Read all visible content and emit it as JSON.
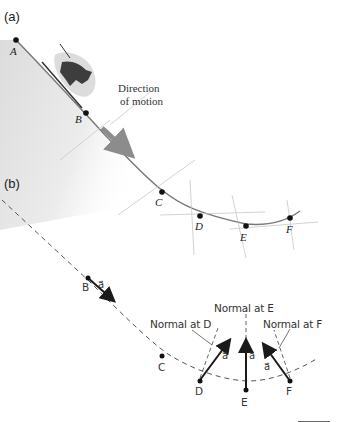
{
  "panels": {
    "a": {
      "label": "(a)"
    },
    "b": {
      "label": "(b)"
    }
  },
  "panel_a": {
    "points": [
      "A",
      "B",
      "C",
      "D",
      "E",
      "F"
    ],
    "direction_label_line1": "Direction",
    "direction_label_line2": "of motion"
  },
  "panel_b": {
    "points": {
      "B": "B",
      "C": "C",
      "D": "D",
      "E": "E",
      "F": "F"
    },
    "vector_symbol": "a⃗",
    "normals": {
      "D": "Normal at D",
      "E": "Normal at E",
      "F": "Normal at F"
    }
  },
  "colors": {
    "slope_fill": "#e3e3e3",
    "track": "#7a7a7a",
    "arrow": "#1a1a1a",
    "dashed": "#555555",
    "direction_arrow": "#8c8c8c"
  }
}
